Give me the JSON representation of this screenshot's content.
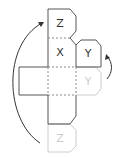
{
  "diagram": {
    "faces": {
      "top_z": {
        "label": "Z"
      },
      "x_face": {
        "label": "X"
      },
      "y_folded": {
        "label": "Y"
      },
      "y_flat": {
        "label": "Y"
      },
      "bottom_z": {
        "label": "Z"
      }
    },
    "colors": {
      "solid_edge": "#555555",
      "faded_edge": "#cccccc",
      "dashed_fold": "#888888",
      "arrow": "#333333"
    }
  }
}
